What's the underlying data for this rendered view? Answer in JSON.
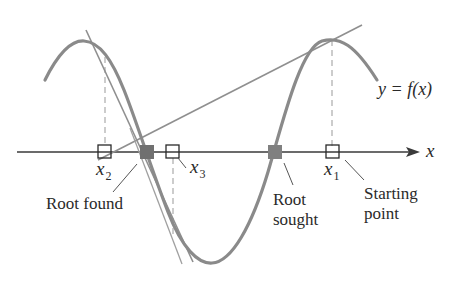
{
  "figure": {
    "function_label": "y = f(x)",
    "axis_label": "x",
    "points": [
      {
        "id": "x1",
        "name": "x",
        "subscript": "1",
        "role": "starting point"
      },
      {
        "id": "x2",
        "name": "x",
        "subscript": "2"
      },
      {
        "id": "x3",
        "name": "x",
        "subscript": "3"
      }
    ],
    "annotations": {
      "root_found": "Root found",
      "root_sought_line1": "Root",
      "root_sought_line2": "sought",
      "starting_point_line1": "Starting",
      "starting_point_line2": "point"
    },
    "colors": {
      "curve": "#8a8a8a",
      "tangent": "#8f8f8f",
      "axis": "#3a3a3a",
      "root_marker": "#707070",
      "text": "#2a2a2a"
    }
  }
}
